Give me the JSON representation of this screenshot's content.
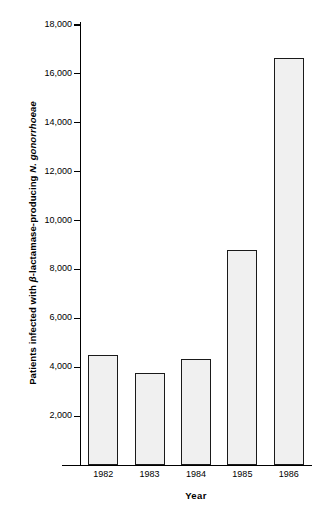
{
  "chart_data": {
    "type": "bar",
    "title": "",
    "categories": [
      "1982",
      "1983",
      "1984",
      "1985",
      "1986"
    ],
    "values": [
      4500,
      3750,
      4350,
      8800,
      16650
    ],
    "series": [
      {
        "name": "Patients infected with beta-lactamase-producing N. gonorrhoeae",
        "values": [
          4500,
          3750,
          4350,
          8800,
          16650
        ]
      }
    ],
    "xlabel": "Year",
    "ylabel": "Patients infected with β-lactamase-producing N. gonorrhoeae",
    "ylabel_parts": {
      "plain_prefix": "Patients infected with ",
      "beta": "β",
      "plain_middle": "-lactamase-producing ",
      "italic_suffix": "N. gonorrhoeae"
    },
    "ylim": [
      0,
      18000
    ],
    "yticks": [
      2000,
      4000,
      6000,
      8000,
      10000,
      12000,
      14000,
      16000,
      18000
    ],
    "ytick_labels": [
      "2,000",
      "4,000",
      "6,000",
      "8,000",
      "10,000",
      "12,000",
      "14,000",
      "16,000",
      "18,000"
    ],
    "xtick_labels": [
      "1982",
      "1983",
      "1984",
      "1985",
      "1986"
    ],
    "grid": false,
    "legend": null,
    "legend_position": "none",
    "colors": {
      "bar_fill": "#f0f0f0",
      "bar_border": "#1a1a1a",
      "axis": "#000000",
      "text": "#000000",
      "background": "#ffffff"
    }
  }
}
